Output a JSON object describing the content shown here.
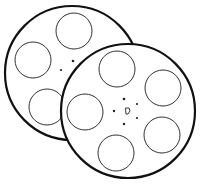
{
  "image": {
    "subject": "two film reels line drawing",
    "colors": {
      "background": "#ffffff",
      "line": "#111111"
    },
    "reels": [
      {
        "name": "back-reel",
        "holes": 5
      },
      {
        "name": "front-reel",
        "holes": 5
      }
    ]
  }
}
